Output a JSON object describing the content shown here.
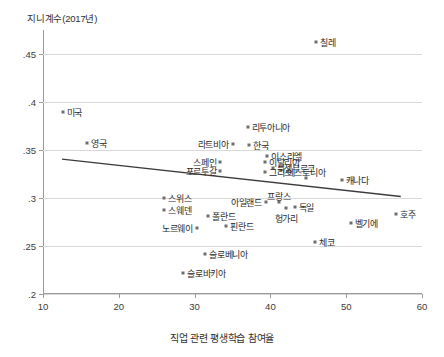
{
  "chart_data": {
    "type": "scatter",
    "title": "",
    "ylabel": "지니계수(2017년)",
    "xlabel": "직업 관련 평생학습 참여율",
    "xlim": [
      10,
      60
    ],
    "ylim": [
      0.2,
      0.475
    ],
    "xticks": [
      10,
      20,
      30,
      40,
      50,
      60
    ],
    "xtick_labels": [
      "10",
      "20",
      "30",
      "40",
      "50",
      "60"
    ],
    "yticks": [
      0.2,
      0.25,
      0.3,
      0.35,
      0.4,
      0.45
    ],
    "ytick_labels": [
      ".2",
      ".25",
      ".3",
      ".35",
      ".4",
      ".45"
    ],
    "grid": true,
    "legend": "none",
    "marker_color": "#6e6e6e",
    "line_color": "#3c3c3c",
    "grid_color": "#d9d9d9",
    "points": [
      {
        "label": "칠레",
        "x": 46.0,
        "y": 0.462,
        "lp": "right"
      },
      {
        "label": "미국",
        "x": 12.6,
        "y": 0.39,
        "lp": "right"
      },
      {
        "label": "영국",
        "x": 15.8,
        "y": 0.357,
        "lp": "right"
      },
      {
        "label": "리투아니아",
        "x": 37.0,
        "y": 0.374,
        "lp": "right"
      },
      {
        "label": "라트비아",
        "x": 35.0,
        "y": 0.356,
        "lp": "left"
      },
      {
        "label": "한국",
        "x": 37.2,
        "y": 0.355,
        "lp": "right"
      },
      {
        "label": "이스라엘",
        "x": 39.6,
        "y": 0.344,
        "lp": "right"
      },
      {
        "label": "스페인",
        "x": 33.4,
        "y": 0.338,
        "lp": "left"
      },
      {
        "label": "이탈리아",
        "x": 39.3,
        "y": 0.337,
        "lp": "right"
      },
      {
        "label": "룩셈부르크",
        "x": 40.3,
        "y": 0.331,
        "lp": "right"
      },
      {
        "label": "포르투갈",
        "x": 33.4,
        "y": 0.328,
        "lp": "left"
      },
      {
        "label": "그리스",
        "x": 39.3,
        "y": 0.327,
        "lp": "right"
      },
      {
        "label": "에스토니아",
        "x": 44.7,
        "y": 0.321,
        "lp": "above"
      },
      {
        "label": "캐나다",
        "x": 49.4,
        "y": 0.319,
        "lp": "right"
      },
      {
        "label": "스위스",
        "x": 26.0,
        "y": 0.3,
        "lp": "right"
      },
      {
        "label": "스웨덴",
        "x": 26.0,
        "y": 0.287,
        "lp": "right"
      },
      {
        "label": "아일랜드",
        "x": 39.4,
        "y": 0.296,
        "lp": "left"
      },
      {
        "label": "프랑스",
        "x": 41.1,
        "y": 0.296,
        "lp": "above"
      },
      {
        "label": "독일",
        "x": 43.2,
        "y": 0.291,
        "lp": "right"
      },
      {
        "label": "헝가리",
        "x": 42.1,
        "y": 0.29,
        "lp": "below"
      },
      {
        "label": "호주",
        "x": 56.6,
        "y": 0.283,
        "lp": "right"
      },
      {
        "label": "폴란드",
        "x": 31.8,
        "y": 0.281,
        "lp": "right"
      },
      {
        "label": "벨기에",
        "x": 50.6,
        "y": 0.274,
        "lp": "right"
      },
      {
        "label": "노르웨이",
        "x": 30.3,
        "y": 0.269,
        "lp": "left"
      },
      {
        "label": "핀란드",
        "x": 34.2,
        "y": 0.271,
        "lp": "right"
      },
      {
        "label": "체코",
        "x": 45.9,
        "y": 0.254,
        "lp": "right"
      },
      {
        "label": "슬로베니아",
        "x": 31.4,
        "y": 0.242,
        "lp": "right"
      },
      {
        "label": "슬로바키아",
        "x": 28.5,
        "y": 0.222,
        "lp": "right"
      }
    ],
    "trendline": {
      "x0": 12.5,
      "y0": 0.3405,
      "x1": 57.2,
      "y1": 0.3015
    }
  }
}
